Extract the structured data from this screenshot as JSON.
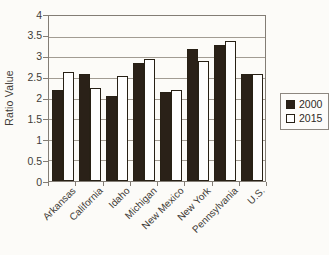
{
  "chart_data": {
    "type": "bar",
    "title": "",
    "xlabel": "",
    "ylabel": "Ratio Value",
    "ylim": [
      0,
      4
    ],
    "ytick_step": 0.5,
    "ytick_labels": [
      "0",
      "0.5",
      "1",
      "1.5",
      "2",
      "2.5",
      "3",
      "3.5",
      "4"
    ],
    "grid": "horizontal",
    "legend_position": "right",
    "categories": [
      "Arkansas",
      "California",
      "Idaho",
      "Michigan",
      "New Mexico",
      "New York",
      "Pennsylvania",
      "U.S."
    ],
    "series": [
      {
        "name": "2000",
        "fill": "#2a2118",
        "values": [
          2.2,
          2.6,
          2.05,
          2.85,
          2.15,
          3.2,
          3.3,
          2.6
        ]
      },
      {
        "name": "2015",
        "fill": "#fefefe",
        "values": [
          2.65,
          2.25,
          2.55,
          2.95,
          2.2,
          2.9,
          3.4,
          2.6
        ]
      }
    ],
    "colors": {
      "gridline": "#a29c93",
      "axis": "#837d75",
      "text": "#3f3b37"
    }
  }
}
